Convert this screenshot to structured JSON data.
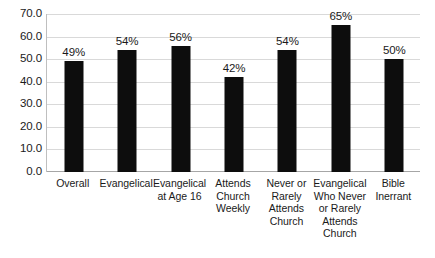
{
  "chart_data": {
    "type": "bar",
    "title": "",
    "subtitle": "",
    "xlabel": "",
    "ylabel": "",
    "ylim": [
      0,
      70
    ],
    "ytick_step": 10,
    "grid": true,
    "legend": false,
    "bar_color": "#0d0d0d",
    "gridline_color": "#d9d9d9",
    "background_color": "#ffffff",
    "value_suffix": "%",
    "categories": [
      "Overall",
      "Evangelical",
      "Evangelical at Age 16",
      "Attends Church Weekly",
      "Never or Rarely Attends Church",
      "Evangelical Who Never or Rarely Attends Church",
      "Bible Inerrant"
    ],
    "values": [
      49,
      54,
      56,
      42,
      54,
      65,
      50
    ],
    "value_labels": [
      "49%",
      "54%",
      "56%",
      "42%",
      "54%",
      "65%",
      "50%"
    ],
    "ytick_labels": [
      "70.0",
      "60.0",
      "50.0",
      "40.0",
      "30.0",
      "20.0",
      "10.0",
      "0.0"
    ],
    "ytick_values": [
      70,
      60,
      50,
      40,
      30,
      20,
      10,
      0
    ]
  }
}
